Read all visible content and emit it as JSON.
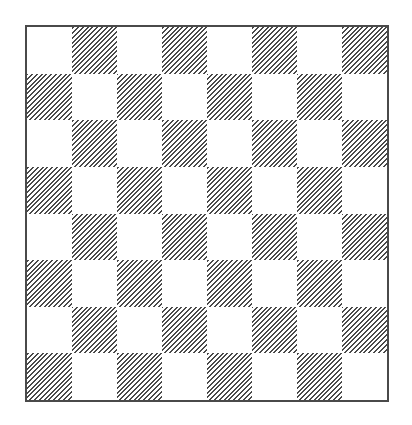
{
  "board": {
    "rows": 8,
    "cols": 8,
    "light_color": "#ffffff",
    "dark_style": "diagonal-hatch",
    "hatch_color": "#4a4a4a",
    "border_color": "#4a4a4a",
    "dark_rule": "row+col odd",
    "cells": [
      [
        "light",
        "dark",
        "light",
        "dark",
        "light",
        "dark",
        "light",
        "dark"
      ],
      [
        "dark",
        "light",
        "dark",
        "light",
        "dark",
        "light",
        "dark",
        "light"
      ],
      [
        "light",
        "dark",
        "light",
        "dark",
        "light",
        "dark",
        "light",
        "dark"
      ],
      [
        "dark",
        "light",
        "dark",
        "light",
        "dark",
        "light",
        "dark",
        "light"
      ],
      [
        "light",
        "dark",
        "light",
        "dark",
        "light",
        "dark",
        "light",
        "dark"
      ],
      [
        "dark",
        "light",
        "dark",
        "light",
        "dark",
        "light",
        "dark",
        "light"
      ],
      [
        "light",
        "dark",
        "light",
        "dark",
        "light",
        "dark",
        "light",
        "dark"
      ],
      [
        "dark",
        "light",
        "dark",
        "light",
        "dark",
        "light",
        "dark",
        "light"
      ]
    ]
  }
}
